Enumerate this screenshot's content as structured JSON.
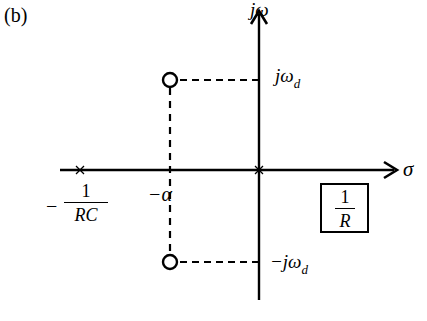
{
  "figure": {
    "panel_label": "(b)",
    "axes": {
      "vertical_label": "jω",
      "horizontal_label": "σ"
    },
    "markers": {
      "upper_zero_label": "jω",
      "upper_zero_sub": "d",
      "lower_zero_label": "−jω",
      "lower_zero_sub": "d",
      "alpha_label": "−α",
      "pole_label_sign": "−",
      "pole_label_num": "1",
      "pole_label_den": "RC"
    },
    "gain_box": {
      "num": "1",
      "den": "R"
    },
    "elements": [
      {
        "type": "pole",
        "symbol": "x",
        "position": "-1/RC"
      },
      {
        "type": "pole",
        "symbol": "x",
        "position": "0"
      },
      {
        "type": "zero",
        "symbol": "o",
        "position": "-α + jω_d"
      },
      {
        "type": "zero",
        "symbol": "o",
        "position": "-α - jω_d"
      }
    ],
    "colors": {
      "stroke": "#000000",
      "background": "#ffffff"
    }
  }
}
